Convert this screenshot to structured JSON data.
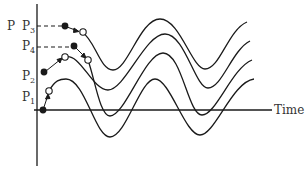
{
  "diagram": {
    "y_axis_label": "P",
    "x_axis_label": "Time",
    "phase_labels": [
      {
        "name": "P",
        "sub": "3"
      },
      {
        "name": "P",
        "sub": "4"
      },
      {
        "name": "P",
        "sub": "2"
      },
      {
        "name": "P",
        "sub": "1"
      }
    ],
    "curves": 4,
    "transitions": [
      {
        "from": "P1",
        "filled_point": "start",
        "open_point": "end"
      },
      {
        "from": "P2",
        "filled_point": "start",
        "open_point": "end"
      },
      {
        "from": "P3",
        "filled_point": "start",
        "open_point": "end"
      },
      {
        "from": "P4",
        "filled_point": "start",
        "open_point": "end"
      }
    ],
    "colors": {
      "line": "#1a1a1a",
      "text": "#333333"
    }
  }
}
